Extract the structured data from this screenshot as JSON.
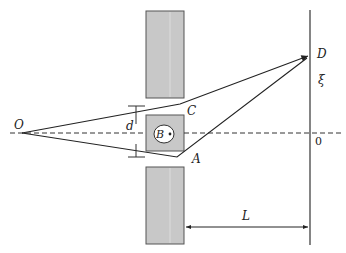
{
  "diagram": {
    "type": "physics-double-slit-aharonov-bohm",
    "labels": {
      "source": "O",
      "slit_upper": "C",
      "slit_lower": "A",
      "flux_region": "B",
      "screen_point": "D",
      "screen_coordinate": "ξ",
      "screen_origin": "0",
      "slit_separation": "d",
      "screen_distance": "L"
    },
    "colors": {
      "barrier_fill": "#c8c8c8",
      "barrier_stroke": "#555555",
      "line": "#222222",
      "background": "#ffffff"
    }
  }
}
